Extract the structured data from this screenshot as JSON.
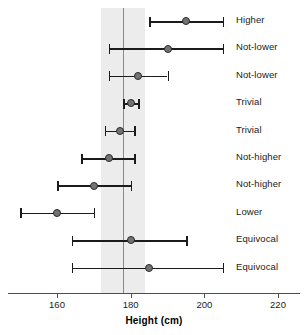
{
  "chart_data": {
    "type": "scatter",
    "subtype": "forest-plot",
    "title": "",
    "xlabel": "Height (cm)",
    "ylabel": "",
    "xlim": [
      148,
      226
    ],
    "xticks": [
      160,
      180,
      200,
      220
    ],
    "xticklabels": [
      "160",
      "180",
      "200",
      "220"
    ],
    "grid": false,
    "legend": "none",
    "reference_line": 178,
    "reference_band": [
      172,
      184
    ],
    "reference_band_color": "#ececec",
    "point_color": "#737373",
    "line_color": "#1b1b1b",
    "categories": [
      "Higher",
      "Not-lower",
      "Not-lower",
      "Trivial",
      "Trivial",
      "Not-higher",
      "Not-higher",
      "Lower",
      "Equivocal",
      "Equivocal"
    ],
    "rows": [
      {
        "label": "Higher",
        "estimate": 195,
        "low": 185,
        "high": 205
      },
      {
        "label": "Not-lower",
        "estimate": 190,
        "low": 174,
        "high": 205
      },
      {
        "label": "Not-lower",
        "estimate": 182,
        "low": 174,
        "high": 190
      },
      {
        "label": "Trivial",
        "estimate": 180,
        "low": 178,
        "high": 182
      },
      {
        "label": "Trivial",
        "estimate": 177,
        "low": 173,
        "high": 181
      },
      {
        "label": "Not-higher",
        "estimate": 174,
        "low": 166.5,
        "high": 181
      },
      {
        "label": "Not-higher",
        "estimate": 170,
        "low": 160,
        "high": 180
      },
      {
        "label": "Lower",
        "estimate": 160,
        "low": 150,
        "high": 170
      },
      {
        "label": "Equivocal",
        "estimate": 180,
        "low": 164,
        "high": 195
      },
      {
        "label": "Equivocal",
        "estimate": 185,
        "low": 164,
        "high": 205
      }
    ]
  }
}
